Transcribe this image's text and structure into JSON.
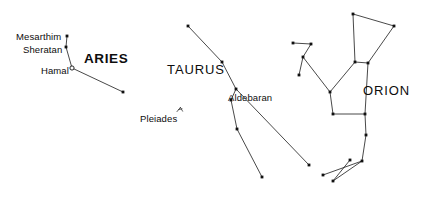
{
  "canvas": {
    "width": 430,
    "height": 203,
    "background_color": "#ffffff",
    "line_color": "#1a1a1a",
    "star_color": "#111111"
  },
  "labels": {
    "constellations": [
      {
        "name": "aries",
        "text": "ARIES",
        "x": 84,
        "y": 52,
        "bold": true
      },
      {
        "name": "taurus",
        "text": "TAURUS",
        "x": 167,
        "y": 63,
        "bold": false
      },
      {
        "name": "orion",
        "text": "ORION",
        "x": 363,
        "y": 84,
        "bold": false
      }
    ],
    "stars": [
      {
        "name": "mesarthim",
        "text": "Mesarthim",
        "x": 16,
        "y": 32
      },
      {
        "name": "sheratan",
        "text": "Sheratan",
        "x": 23,
        "y": 45
      },
      {
        "name": "hamal",
        "text": "Hamal",
        "x": 41,
        "y": 66
      },
      {
        "name": "aldebaran",
        "text": "Aldebaran",
        "x": 228,
        "y": 93
      },
      {
        "name": "pleiades",
        "text": "Pleiades",
        "x": 140,
        "y": 114
      }
    ]
  },
  "chart_data": {
    "type": "scatter",
    "xlabel": "",
    "ylabel": "",
    "xlim": [
      0,
      430
    ],
    "ylim": [
      0,
      203
    ],
    "grid": false,
    "legend": "none",
    "note": "Sky map showing three constellations with stick-figure asterism lines; named stars Mesarthim, Sheratan, Hamal (open marker), Aldebaran, plus the Pleiades open cluster marker.",
    "constellations": [
      {
        "name": "Aries",
        "label_bold": true,
        "stars": [
          {
            "id": "mesarthim",
            "label": "Mesarthim",
            "x": 67,
            "y": 36,
            "marker": "filled"
          },
          {
            "id": "sheratan",
            "label": "Sheratan",
            "x": 66,
            "y": 47,
            "marker": "filled"
          },
          {
            "id": "hamal",
            "label": "Hamal",
            "x": 72,
            "y": 68,
            "marker": "open"
          },
          {
            "id": "aries-d",
            "label": "",
            "x": 123,
            "y": 92,
            "marker": "filled"
          }
        ],
        "lines": [
          [
            "mesarthim",
            "sheratan"
          ],
          [
            "sheratan",
            "hamal"
          ],
          [
            "hamal",
            "aries-d"
          ]
        ]
      },
      {
        "name": "Taurus",
        "label_bold": false,
        "stars": [
          {
            "id": "horn-n",
            "label": "",
            "x": 188,
            "y": 26,
            "marker": "filled"
          },
          {
            "id": "mid-n",
            "label": "",
            "x": 222,
            "y": 62,
            "marker": "filled"
          },
          {
            "id": "aldebaran",
            "label": "Aldebaran",
            "x": 236,
            "y": 89,
            "marker": "filled"
          },
          {
            "id": "face-w",
            "label": "",
            "x": 231,
            "y": 100,
            "marker": "filled"
          },
          {
            "id": "face-s",
            "label": "",
            "x": 237,
            "y": 129,
            "marker": "filled"
          },
          {
            "id": "horn-s",
            "label": "",
            "x": 262,
            "y": 177,
            "marker": "filled"
          },
          {
            "id": "tail-e",
            "label": "",
            "x": 309,
            "y": 165,
            "marker": "filled"
          }
        ],
        "lines": [
          [
            "horn-n",
            "mid-n"
          ],
          [
            "mid-n",
            "aldebaran"
          ],
          [
            "aldebaran",
            "face-w"
          ],
          [
            "face-w",
            "face-s"
          ],
          [
            "face-s",
            "horn-s"
          ],
          [
            "aldebaran",
            "tail-e"
          ]
        ],
        "clusters": [
          {
            "id": "pleiades",
            "label": "Pleiades",
            "x": 180,
            "y": 110,
            "marker": "cluster"
          }
        ]
      },
      {
        "name": "Orion",
        "label_bold": false,
        "stars": [
          {
            "id": "shield-nw",
            "label": "",
            "x": 353,
            "y": 14,
            "marker": "filled"
          },
          {
            "id": "shield-ne",
            "label": "",
            "x": 394,
            "y": 26,
            "marker": "filled"
          },
          {
            "id": "shoulder-e",
            "label": "",
            "x": 368,
            "y": 63,
            "marker": "filled"
          },
          {
            "id": "shoulder-w",
            "label": "",
            "x": 355,
            "y": 62,
            "marker": "filled"
          },
          {
            "id": "arm-mid",
            "label": "",
            "x": 330,
            "y": 92,
            "marker": "filled"
          },
          {
            "id": "belt-w",
            "label": "",
            "x": 333,
            "y": 114,
            "marker": "filled"
          },
          {
            "id": "belt-e",
            "label": "",
            "x": 365,
            "y": 114,
            "marker": "filled"
          },
          {
            "id": "knee",
            "label": "",
            "x": 366,
            "y": 135,
            "marker": "filled"
          },
          {
            "id": "foot-join",
            "label": "",
            "x": 362,
            "y": 161,
            "marker": "filled"
          },
          {
            "id": "foot-mid",
            "label": "",
            "x": 350,
            "y": 160,
            "marker": "filled"
          },
          {
            "id": "foot-w1",
            "label": "",
            "x": 323,
            "y": 175,
            "marker": "filled"
          },
          {
            "id": "foot-w2",
            "label": "",
            "x": 333,
            "y": 181,
            "marker": "filled"
          },
          {
            "id": "bow-n",
            "label": "",
            "x": 311,
            "y": 44,
            "marker": "filled"
          },
          {
            "id": "bow-tip",
            "label": "",
            "x": 293,
            "y": 43,
            "marker": "filled"
          },
          {
            "id": "bow-mid",
            "label": "",
            "x": 303,
            "y": 57,
            "marker": "filled"
          },
          {
            "id": "bow-s",
            "label": "",
            "x": 299,
            "y": 75,
            "marker": "filled"
          }
        ],
        "lines": [
          [
            "shield-nw",
            "shield-ne"
          ],
          [
            "shield-ne",
            "shoulder-e"
          ],
          [
            "shield-nw",
            "shoulder-w"
          ],
          [
            "shoulder-w",
            "shoulder-e"
          ],
          [
            "shoulder-w",
            "arm-mid"
          ],
          [
            "arm-mid",
            "belt-w"
          ],
          [
            "belt-w",
            "belt-e"
          ],
          [
            "shoulder-e",
            "belt-e"
          ],
          [
            "belt-e",
            "knee"
          ],
          [
            "knee",
            "foot-join"
          ],
          [
            "foot-join",
            "foot-w1"
          ],
          [
            "foot-join",
            "foot-w2"
          ],
          [
            "foot-mid",
            "foot-w2"
          ],
          [
            "bow-tip",
            "bow-n"
          ],
          [
            "bow-n",
            "bow-mid"
          ],
          [
            "bow-mid",
            "bow-s"
          ],
          [
            "bow-mid",
            "arm-mid"
          ]
        ]
      }
    ]
  }
}
